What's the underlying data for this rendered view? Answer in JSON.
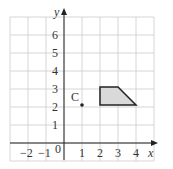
{
  "chart_data": {
    "type": "scatter",
    "title": "",
    "xlabel": "x",
    "ylabel": "y",
    "xlim": [
      -3,
      5
    ],
    "ylim": [
      -1,
      7
    ],
    "grid": true,
    "x_ticks": [
      "-2",
      "-1",
      "0",
      "1",
      "2",
      "3",
      "4"
    ],
    "y_ticks": [
      "1",
      "2",
      "3",
      "4",
      "5",
      "6"
    ],
    "points": [
      {
        "label": "C",
        "x": 1,
        "y": 2
      }
    ],
    "polygons": [
      {
        "name": "trapezium",
        "vertices": [
          [
            2,
            2
          ],
          [
            2,
            3
          ],
          [
            3,
            3
          ],
          [
            4,
            2
          ]
        ],
        "fill": "#d9d9d9"
      }
    ]
  },
  "labels": {
    "x": "x",
    "y": "y",
    "origin": "0",
    "point": "C"
  }
}
